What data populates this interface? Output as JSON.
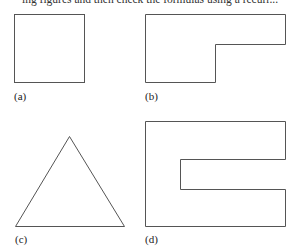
{
  "header": {
    "cropped_text": "ing figures and then check the formulas using a recurr..."
  },
  "figures": [
    {
      "id": "a",
      "label": "(a)",
      "shape": "square"
    },
    {
      "id": "b",
      "label": "(b)",
      "shape": "L-shape"
    },
    {
      "id": "c",
      "label": "(c)",
      "shape": "triangle"
    },
    {
      "id": "d",
      "label": "(d)",
      "shape": "C-shape"
    }
  ],
  "colors": {
    "stroke": "#555555",
    "text": "#222222",
    "background": "#ffffff"
  }
}
